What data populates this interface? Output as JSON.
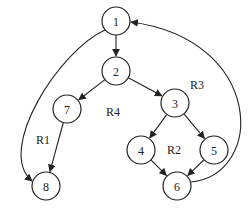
{
  "diagram": {
    "type": "control-flow-graph",
    "nodes": [
      {
        "id": "1",
        "label": "1"
      },
      {
        "id": "2",
        "label": "2"
      },
      {
        "id": "3",
        "label": "3"
      },
      {
        "id": "4",
        "label": "4"
      },
      {
        "id": "5",
        "label": "5"
      },
      {
        "id": "6",
        "label": "6"
      },
      {
        "id": "7",
        "label": "7"
      },
      {
        "id": "8",
        "label": "8"
      }
    ],
    "edges": [
      {
        "from": "1",
        "to": "2"
      },
      {
        "from": "1",
        "to": "8"
      },
      {
        "from": "2",
        "to": "7"
      },
      {
        "from": "2",
        "to": "3"
      },
      {
        "from": "7",
        "to": "8"
      },
      {
        "from": "3",
        "to": "4"
      },
      {
        "from": "3",
        "to": "5"
      },
      {
        "from": "4",
        "to": "6"
      },
      {
        "from": "5",
        "to": "6"
      },
      {
        "from": "6",
        "to": "1"
      }
    ],
    "regions": [
      {
        "id": "R1",
        "label": "R1"
      },
      {
        "id": "R2",
        "label": "R2"
      },
      {
        "id": "R3",
        "label": "R3"
      },
      {
        "id": "R4",
        "label": "R4"
      }
    ]
  }
}
